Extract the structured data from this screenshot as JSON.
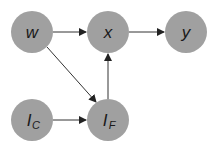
{
  "diagram": {
    "type": "directed-graph",
    "nodes": [
      {
        "id": "w",
        "label": "w",
        "sub": "",
        "cx": 32,
        "cy": 32
      },
      {
        "id": "x",
        "label": "x",
        "sub": "",
        "cx": 108,
        "cy": 32
      },
      {
        "id": "y",
        "label": "y",
        "sub": "",
        "cx": 186,
        "cy": 32
      },
      {
        "id": "IC",
        "label": "I",
        "sub": "C",
        "cx": 32,
        "cy": 120
      },
      {
        "id": "IF",
        "label": "I",
        "sub": "F",
        "cx": 108,
        "cy": 120
      }
    ],
    "edges": [
      {
        "from": "w",
        "to": "x"
      },
      {
        "from": "x",
        "to": "y"
      },
      {
        "from": "w",
        "to": "IF"
      },
      {
        "from": "IC",
        "to": "IF"
      },
      {
        "from": "IF",
        "to": "x"
      }
    ],
    "colors": {
      "node_fill": "#a0a0a0",
      "edge": "#333333",
      "text": "#1a1a1a"
    }
  }
}
